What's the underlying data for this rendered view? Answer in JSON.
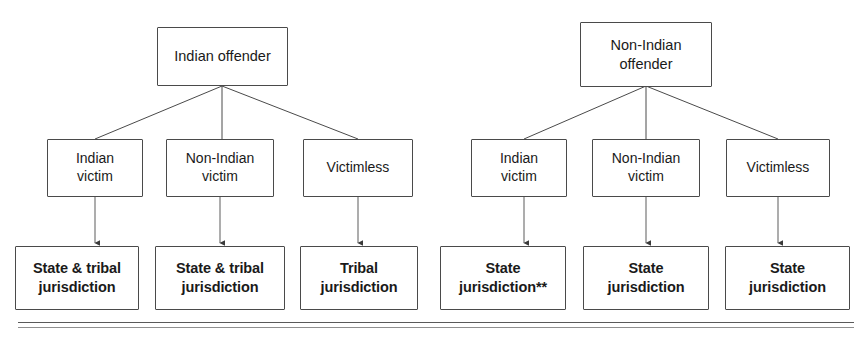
{
  "diagram": {
    "type": "flowchart",
    "title": "",
    "background_color": "#ffffff",
    "box_border_color": "#4a4a4a",
    "text_color": "#1a1a1a",
    "branches": [
      {
        "id": "indian-offender",
        "root": {
          "label": "Indian offender"
        },
        "children": [
          {
            "label": "Indian\nvictim",
            "outcome": "State & tribal\njurisdiction"
          },
          {
            "label": "Non-Indian\nvictim",
            "outcome": "State & tribal\njurisdiction"
          },
          {
            "label": "Victimless",
            "outcome": "Tribal\njurisdiction"
          }
        ]
      },
      {
        "id": "non-indian-offender",
        "root": {
          "label": "Non-Indian\noffender"
        },
        "children": [
          {
            "label": "Indian\nvictim",
            "outcome": "State\njurisdiction**"
          },
          {
            "label": "Non-Indian\nvictim",
            "outcome": "State\njurisdiction"
          },
          {
            "label": "Victimless",
            "outcome": "State\njurisdiction"
          }
        ]
      }
    ],
    "nodes": {
      "root_left": "Indian offender",
      "root_right": "Non-Indian\noffender",
      "mid_l1": "Indian\nvictim",
      "mid_l2": "Non-Indian\nvictim",
      "mid_l3": "Victimless",
      "mid_r1": "Indian\nvictim",
      "mid_r2": "Non-Indian\nvictim",
      "mid_r3": "Victimless",
      "out_l1": "State & tribal\njurisdiction",
      "out_l2": "State & tribal\njurisdiction",
      "out_l3": "Tribal\njurisdiction",
      "out_r1": "State\njurisdiction**",
      "out_r2": "State\njurisdiction",
      "out_r3": "State\njurisdiction"
    },
    "footnote_marker": "**"
  }
}
